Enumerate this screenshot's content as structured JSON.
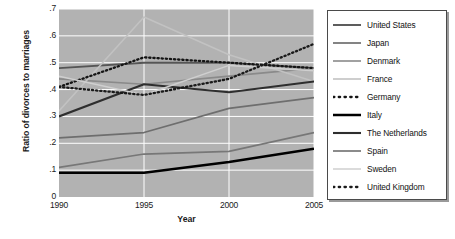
{
  "chart_data": {
    "type": "line",
    "title": "",
    "xlabel": "Year",
    "ylabel": "Ratio of divorces to marriages",
    "x": [
      1990,
      1995,
      2000,
      2005
    ],
    "xlim": [
      1990,
      2005
    ],
    "ylim": [
      0,
      0.7
    ],
    "xticks": [
      "1990",
      "1995",
      "2000",
      "2005"
    ],
    "yticks": [
      "0",
      ".1",
      ".2",
      ".3",
      ".4",
      ".5",
      ".6",
      ".7"
    ],
    "ytick_values": [
      0,
      0.1,
      0.2,
      0.3,
      0.4,
      0.5,
      0.6,
      0.7
    ],
    "grid": true,
    "grid_color": "#ffffff",
    "plot_background": "#b2b2b2",
    "legend_position": "right-outside",
    "series": [
      {
        "name": "United States",
        "values": [
          0.48,
          0.5,
          0.5,
          0.48
        ],
        "color": "#555555",
        "width": 1.9,
        "style": "solid"
      },
      {
        "name": "Japan",
        "values": [
          0.22,
          0.24,
          0.33,
          0.37
        ],
        "color": "#6e6e6e",
        "width": 1.7,
        "style": "solid"
      },
      {
        "name": "Denmark",
        "values": [
          0.44,
          0.42,
          0.45,
          0.48
        ],
        "color": "#8a8a8a",
        "width": 1.6,
        "style": "solid"
      },
      {
        "name": "France",
        "values": [
          0.32,
          0.67,
          0.53,
          0.43
        ],
        "color": "#c2c2c2",
        "width": 1.6,
        "style": "solid"
      },
      {
        "name": "Germany",
        "values": [
          0.41,
          0.52,
          0.5,
          0.48
        ],
        "color": "#141414",
        "width": 2.3,
        "style": "dotted"
      },
      {
        "name": "Italy",
        "values": [
          0.09,
          0.09,
          0.13,
          0.18
        ],
        "color": "#000000",
        "width": 2.5,
        "style": "solid"
      },
      {
        "name": "The Netherlands",
        "values": [
          0.3,
          0.42,
          0.39,
          0.43
        ],
        "color": "#2e2e2e",
        "width": 2.1,
        "style": "solid"
      },
      {
        "name": "Spain",
        "values": [
          0.11,
          0.16,
          0.17,
          0.24
        ],
        "color": "#777777",
        "width": 1.7,
        "style": "solid"
      },
      {
        "name": "Sweden",
        "values": [
          0.45,
          0.38,
          0.49,
          0.47
        ],
        "color": "#cfcfcf",
        "width": 1.5,
        "style": "solid"
      },
      {
        "name": "United Kingdom",
        "values": [
          0.41,
          0.38,
          0.44,
          0.57
        ],
        "color": "#1a1a1a",
        "width": 2.3,
        "style": "dotted"
      }
    ]
  },
  "legend": {
    "items": [
      {
        "label": "United States"
      },
      {
        "label": "Japan"
      },
      {
        "label": "Denmark"
      },
      {
        "label": "France"
      },
      {
        "label": "Germany"
      },
      {
        "label": "Italy"
      },
      {
        "label": "The Netherlands"
      },
      {
        "label": "Spain"
      },
      {
        "label": "Sweden"
      },
      {
        "label": "United Kingdom"
      }
    ]
  }
}
